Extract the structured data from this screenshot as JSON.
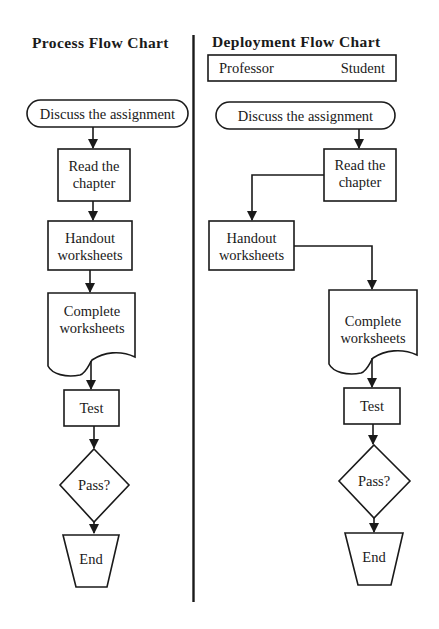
{
  "process_chart": {
    "title": "Process Flow Chart",
    "nodes": {
      "discuss": "Discuss the assignment",
      "read_1": "Read the",
      "read_2": "chapter",
      "handout_1": "Handout",
      "handout_2": "worksheets",
      "complete_1": "Complete",
      "complete_2": "worksheets",
      "test": "Test",
      "pass": "Pass?",
      "end": "End"
    }
  },
  "deployment_chart": {
    "title": "Deployment Flow Chart",
    "lanes": {
      "left": "Professor",
      "right": "Student"
    },
    "nodes": {
      "discuss": "Discuss the assignment",
      "read_1": "Read the",
      "read_2": "chapter",
      "handout_1": "Handout",
      "handout_2": "worksheets",
      "complete_1": "Complete",
      "complete_2": "worksheets",
      "test": "Test",
      "pass": "Pass?",
      "end": "End"
    }
  },
  "colors": {
    "ink": "#1a1a1a",
    "background": "#ffffff"
  }
}
